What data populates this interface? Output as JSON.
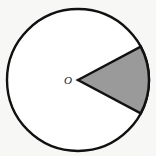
{
  "figure": {
    "kind": "geometry-diagram",
    "background_color": "#f7f7f5",
    "canvas": {
      "width": 156,
      "height": 156
    }
  },
  "circle": {
    "name": "circle-outline",
    "center_x": 78,
    "center_y": 80,
    "radius": 71,
    "stroke_color": "#111111",
    "stroke_width": 2.4,
    "fill_color": "#ffffff"
  },
  "center_point": {
    "name": "center-point-o",
    "label": "O",
    "label_x": 68,
    "label_y": 84,
    "dot_x": 78,
    "dot_y": 80,
    "dot_radius": 1.3,
    "color": "#1a1a1a"
  },
  "sector": {
    "name": "shaded-sector",
    "fill_color": "#9a9a9a",
    "stroke_color": "#111111",
    "stroke_width": 2.4,
    "start_angle_deg": -28,
    "end_angle_deg": 28,
    "sweep_angle_deg": 56,
    "apex_x": 78,
    "apex_y": 80,
    "arc_start_x": 140.7,
    "arc_start_y": 46.7,
    "arc_end_x": 140.7,
    "arc_end_y": 113.3
  }
}
